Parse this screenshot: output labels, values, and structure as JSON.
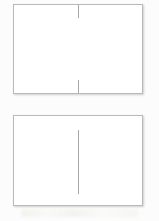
{
  "document": {
    "title": "Blank Panel Diagram",
    "background_color": "#fcfcfc",
    "width": 159,
    "height": 221
  },
  "panels": [
    {
      "id": "panel-top",
      "label": "",
      "border_color": "#b9b9b9",
      "fill_color": "#ffffff",
      "marks": [
        {
          "name": "top-center-tick",
          "label": "",
          "color": "#a8a8a8"
        },
        {
          "name": "bottom-center-tick",
          "label": "",
          "color": "#a8a8a8"
        }
      ]
    },
    {
      "id": "panel-bottom",
      "label": "",
      "border_color": "#b9b9b9",
      "fill_color": "#ffffff",
      "marks": [
        {
          "name": "center-divider-line",
          "label": "",
          "color": "#a8a8a8"
        }
      ]
    }
  ],
  "footer": {
    "text": ""
  }
}
